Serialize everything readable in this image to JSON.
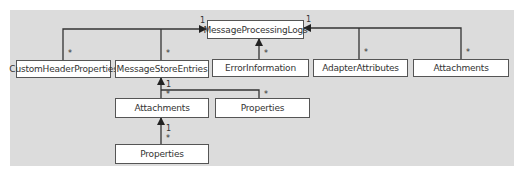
{
  "diagram": {
    "root": {
      "label": "MessageProcessingLogs"
    },
    "children": [
      {
        "label": "CustomHeaderProperties",
        "multiplicity_child": "*",
        "multiplicity_parent": "1"
      },
      {
        "label": "MessageStoreEntries",
        "multiplicity_child": "*"
      },
      {
        "label": "ErrorInformation",
        "multiplicity_child": "*"
      },
      {
        "label": "AdapterAttributes",
        "multiplicity_child": "*",
        "multiplicity_parent": "1"
      },
      {
        "label": "Attachments",
        "multiplicity_child": "*"
      }
    ],
    "store_children": [
      {
        "label": "Attachments",
        "multiplicity_child": "*",
        "multiplicity_parent": "1"
      },
      {
        "label": "Properties",
        "multiplicity_child": "*"
      }
    ],
    "attachment_children": [
      {
        "label": "Properties",
        "multiplicity_child": "*",
        "multiplicity_parent": "1"
      }
    ]
  },
  "colors": {
    "background": "#dcdcdc",
    "box_fill": "#ffffff",
    "line": "#333333"
  }
}
